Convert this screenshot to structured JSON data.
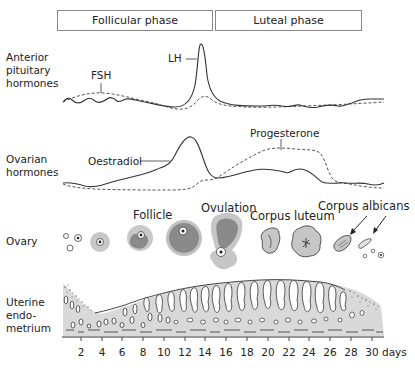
{
  "phases": [
    {
      "label": "Follicular phase"
    },
    {
      "label": "Luteal phase"
    }
  ],
  "rows": {
    "pituitary": "Anterior pituitary hormones",
    "pituitary_lines": [
      "Anterior",
      "pituitary",
      "hormones"
    ],
    "ovarian_lines": [
      "Ovarian",
      "hormones"
    ],
    "ovary": "Ovary",
    "uterine_lines": [
      "Uterine",
      "endo-",
      "metrium"
    ]
  },
  "annotations": {
    "fsh": "FSH",
    "lh": "LH",
    "oestradiol": "Oestradiol",
    "progesterone": "Progesterone",
    "follicle": "Follicle",
    "ovulation": "Ovulation",
    "corpus_luteum": "Corpus luteum",
    "corpus_albicans": "Corpus albicans"
  },
  "axis": {
    "ticks": [
      "2",
      "4",
      "6",
      "8",
      "10",
      "12",
      "14",
      "16",
      "18",
      "20",
      "22",
      "24",
      "26",
      "28",
      "30"
    ],
    "unit": "days"
  },
  "legend": {
    "solid_line": "LH / Oestradiol",
    "dashed_line": "FSH / Progesterone"
  },
  "colors": {
    "line": "#333333",
    "follicle_fill": "#8a8a8a",
    "follicle_halo": "#c8c8c8",
    "endometrium_fill": "#d9d9d9"
  }
}
